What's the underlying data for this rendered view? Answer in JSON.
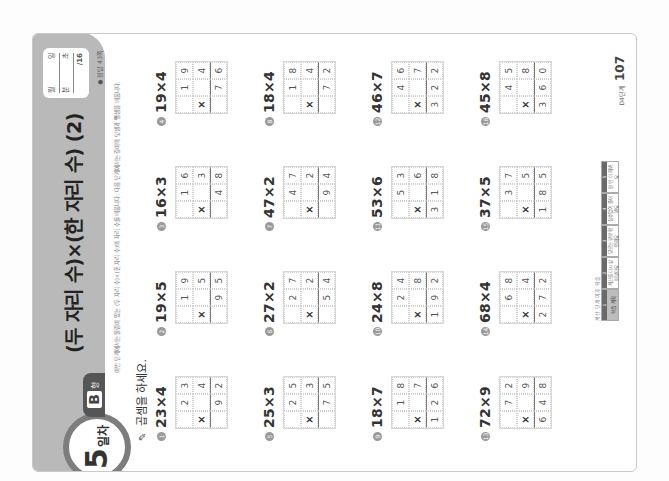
{
  "header": {
    "title": "(두 자리 수)×(한 자리 수) (2)",
    "day_number": "5",
    "day_suffix": "일차",
    "level_letter": "B",
    "level_suffix": "형"
  },
  "score_box": {
    "month_label": "월",
    "day_label": "일",
    "min_label": "분",
    "sec_label": "초",
    "score": "/16"
  },
  "answer_ref": "● 정답 43쪽",
  "intro": "이번 단계에서는 올림이 있는 (두 자리 수)×(한 자리 수)의 자리 수를 배웁니다. 다음 단계에서는 길이의 덧셈과 뺄셈을 배웁니다.",
  "instruction": "곱셈을 하세요.",
  "problems": [
    {
      "num": "1",
      "expr": "23×4",
      "top": [
        "",
        "2",
        "3"
      ],
      "mid": [
        "×",
        "",
        "4"
      ],
      "res": [
        "",
        "9",
        "2"
      ]
    },
    {
      "num": "2",
      "expr": "19×5",
      "top": [
        "",
        "1",
        "9"
      ],
      "mid": [
        "×",
        "",
        "5"
      ],
      "res": [
        "",
        "9",
        "5"
      ]
    },
    {
      "num": "3",
      "expr": "16×3",
      "top": [
        "",
        "1",
        "6"
      ],
      "mid": [
        "×",
        "",
        "3"
      ],
      "res": [
        "",
        "4",
        "8"
      ]
    },
    {
      "num": "4",
      "expr": "19×4",
      "top": [
        "",
        "1",
        "9"
      ],
      "mid": [
        "×",
        "",
        "4"
      ],
      "res": [
        "",
        "7",
        "6"
      ]
    },
    {
      "num": "5",
      "expr": "25×3",
      "top": [
        "",
        "2",
        "5"
      ],
      "mid": [
        "×",
        "",
        "3"
      ],
      "res": [
        "",
        "7",
        "5"
      ]
    },
    {
      "num": "6",
      "expr": "27×2",
      "top": [
        "",
        "2",
        "7"
      ],
      "mid": [
        "×",
        "",
        "2"
      ],
      "res": [
        "",
        "5",
        "4"
      ]
    },
    {
      "num": "7",
      "expr": "47×2",
      "top": [
        "",
        "4",
        "7"
      ],
      "mid": [
        "×",
        "",
        "2"
      ],
      "res": [
        "",
        "9",
        "4"
      ]
    },
    {
      "num": "8",
      "expr": "18×4",
      "top": [
        "",
        "1",
        "8"
      ],
      "mid": [
        "×",
        "",
        "4"
      ],
      "res": [
        "",
        "7",
        "2"
      ]
    },
    {
      "num": "9",
      "expr": "18×7",
      "top": [
        "",
        "1",
        "8"
      ],
      "mid": [
        "×",
        "",
        "7"
      ],
      "res": [
        "1",
        "2",
        "6"
      ]
    },
    {
      "num": "10",
      "expr": "24×8",
      "top": [
        "",
        "2",
        "4"
      ],
      "mid": [
        "×",
        "",
        "8"
      ],
      "res": [
        "1",
        "9",
        "2"
      ]
    },
    {
      "num": "11",
      "expr": "53×6",
      "top": [
        "",
        "5",
        "3"
      ],
      "mid": [
        "×",
        "",
        "6"
      ],
      "res": [
        "3",
        "1",
        "8"
      ]
    },
    {
      "num": "12",
      "expr": "46×7",
      "top": [
        "",
        "4",
        "6"
      ],
      "mid": [
        "×",
        "",
        "7"
      ],
      "res": [
        "3",
        "2",
        "2"
      ]
    },
    {
      "num": "13",
      "expr": "72×9",
      "top": [
        "",
        "7",
        "2"
      ],
      "mid": [
        "×",
        "",
        "9"
      ],
      "res": [
        "6",
        "4",
        "8"
      ]
    },
    {
      "num": "14",
      "expr": "68×4",
      "top": [
        "",
        "6",
        "8"
      ],
      "mid": [
        "×",
        "",
        "4"
      ],
      "res": [
        "2",
        "7",
        "2"
      ]
    },
    {
      "num": "15",
      "expr": "37×5",
      "top": [
        "",
        "3",
        "7"
      ],
      "mid": [
        "×",
        "",
        "5"
      ],
      "res": [
        "1",
        "8",
        "5"
      ]
    },
    {
      "num": "16",
      "expr": "45×8",
      "top": [
        "",
        "4",
        "5"
      ],
      "mid": [
        "×",
        "",
        "8"
      ],
      "res": [
        "3",
        "6",
        "0"
      ]
    }
  ],
  "footer": {
    "caption": "계산 단계 이후 학습",
    "steps": [
      {
        "top": "1",
        "body": "학습 계획"
      },
      {
        "top": "2",
        "body": "계산을 다시 살펴보아요"
      },
      {
        "top": "3",
        "body": "모르는 부분 확인해요"
      },
      {
        "top": "4",
        "body": "실수없이 풀어봐요"
      },
      {
        "top": "5",
        "body": "한 번 더 해봐요"
      }
    ],
    "book_code": "D4단계",
    "page_number": "107"
  },
  "colors": {
    "header_band": "#b9b9b9",
    "badge_ring": "#7d7d7d",
    "level_tab": "#555555"
  }
}
